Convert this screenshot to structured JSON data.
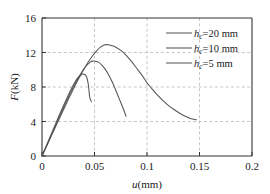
{
  "chart_data": {
    "type": "line",
    "title": "",
    "xlabel": "u(mm)",
    "ylabel": "F(kN)",
    "xlim": [
      0,
      0.2
    ],
    "ylim": [
      0,
      16
    ],
    "xticks": [
      "0",
      "0.05",
      "0.1",
      "0.15",
      "0.2"
    ],
    "xtick_values": [
      0,
      0.05,
      0.1,
      0.15,
      0.2
    ],
    "yticks": [
      "0",
      "4",
      "8",
      "12",
      "16"
    ],
    "ytick_values": [
      0,
      4,
      8,
      12,
      16
    ],
    "grid": true,
    "grid_style": "dashed",
    "grid_color": "#b8b8b8",
    "legend_position": "upper-right",
    "line_color": "#555555",
    "axis_color": "#333333",
    "series": [
      {
        "name": "hc=20 mm",
        "legend_label_prefix": "h",
        "legend_label_sub": "c",
        "legend_label_suffix": "=20 mm",
        "peak_x": 0.06,
        "peak_y": 12.9,
        "end_x": 0.147,
        "end_y": 4.2,
        "points": [
          [
            0.0,
            0.0
          ],
          [
            0.004,
            1.05
          ],
          [
            0.008,
            2.1
          ],
          [
            0.012,
            3.15
          ],
          [
            0.016,
            4.2
          ],
          [
            0.02,
            5.25
          ],
          [
            0.024,
            6.3
          ],
          [
            0.028,
            7.3
          ],
          [
            0.032,
            8.3
          ],
          [
            0.036,
            9.2
          ],
          [
            0.04,
            10.1
          ],
          [
            0.044,
            10.9
          ],
          [
            0.048,
            11.6
          ],
          [
            0.052,
            12.2
          ],
          [
            0.056,
            12.65
          ],
          [
            0.06,
            12.9
          ],
          [
            0.064,
            12.88
          ],
          [
            0.068,
            12.75
          ],
          [
            0.072,
            12.5
          ],
          [
            0.076,
            12.15
          ],
          [
            0.08,
            11.7
          ],
          [
            0.085,
            11.0
          ],
          [
            0.09,
            10.2
          ],
          [
            0.095,
            9.4
          ],
          [
            0.1,
            8.5
          ],
          [
            0.105,
            7.75
          ],
          [
            0.11,
            7.05
          ],
          [
            0.115,
            6.45
          ],
          [
            0.12,
            5.9
          ],
          [
            0.125,
            5.45
          ],
          [
            0.13,
            5.05
          ],
          [
            0.135,
            4.7
          ],
          [
            0.14,
            4.42
          ],
          [
            0.147,
            4.2
          ]
        ]
      },
      {
        "name": "hc=10 mm",
        "legend_label_prefix": "h",
        "legend_label_sub": "c",
        "legend_label_suffix": "=10 mm",
        "peak_x": 0.048,
        "peak_y": 11.0,
        "end_x": 0.08,
        "end_y": 4.6,
        "points": [
          [
            0.0,
            0.0
          ],
          [
            0.004,
            1.1
          ],
          [
            0.008,
            2.2
          ],
          [
            0.012,
            3.3
          ],
          [
            0.016,
            4.4
          ],
          [
            0.02,
            5.5
          ],
          [
            0.024,
            6.55
          ],
          [
            0.028,
            7.55
          ],
          [
            0.032,
            8.5
          ],
          [
            0.036,
            9.35
          ],
          [
            0.04,
            10.1
          ],
          [
            0.043,
            10.55
          ],
          [
            0.046,
            10.88
          ],
          [
            0.048,
            11.0
          ],
          [
            0.051,
            10.98
          ],
          [
            0.054,
            10.85
          ],
          [
            0.057,
            10.55
          ],
          [
            0.06,
            10.1
          ],
          [
            0.063,
            9.5
          ],
          [
            0.066,
            8.8
          ],
          [
            0.069,
            8.0
          ],
          [
            0.072,
            7.1
          ],
          [
            0.075,
            6.2
          ],
          [
            0.078,
            5.3
          ],
          [
            0.08,
            4.6
          ]
        ]
      },
      {
        "name": "hc=5 mm",
        "legend_label_prefix": "h",
        "legend_label_sub": "c",
        "legend_label_suffix": "=5 mm",
        "peak_x": 0.039,
        "peak_y": 9.5,
        "end_x": 0.047,
        "end_y": 6.3,
        "points": [
          [
            0.0,
            0.0
          ],
          [
            0.004,
            1.15
          ],
          [
            0.008,
            2.3
          ],
          [
            0.012,
            3.45
          ],
          [
            0.016,
            4.6
          ],
          [
            0.02,
            5.72
          ],
          [
            0.024,
            6.8
          ],
          [
            0.028,
            7.8
          ],
          [
            0.031,
            8.5
          ],
          [
            0.034,
            9.05
          ],
          [
            0.037,
            9.38
          ],
          [
            0.039,
            9.5
          ],
          [
            0.041,
            9.42
          ],
          [
            0.0425,
            9.15
          ],
          [
            0.0435,
            8.7
          ],
          [
            0.0443,
            8.1
          ],
          [
            0.0449,
            7.4
          ],
          [
            0.0455,
            6.8
          ],
          [
            0.047,
            6.3
          ]
        ]
      }
    ]
  }
}
